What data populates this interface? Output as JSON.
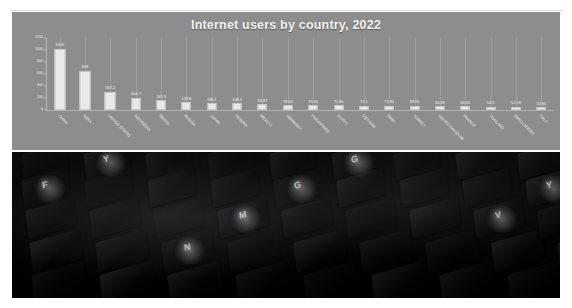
{
  "page": {
    "background_color": "#ffffff",
    "chart_panel_color": "#8d8d8d",
    "photo_caption": "dark photograph of a backlit computer keyboard viewed at an angle"
  },
  "chart_data": {
    "type": "bar",
    "title": "Internet users by country, 2022",
    "xlabel": "",
    "ylabel": "",
    "ylim": [
      0,
      1200
    ],
    "yticks": [
      0,
      200,
      400,
      600,
      800,
      1000,
      1200
    ],
    "grid": true,
    "legend": "none",
    "categories": [
      "CHINA",
      "INDIA",
      "UNITED STATES",
      "INDONESIA",
      "BRAZIL",
      "RUSSIA",
      "JAPAN",
      "NIGERIA",
      "MEXICO",
      "GERMANY",
      "PHILIPPINES",
      "EGYPT",
      "VIETNAM",
      "IRAN",
      "TURKEY",
      "UNITED KINGDOM",
      "FRANCE",
      "THAILAND",
      "BANGLADESH",
      "ITALY"
    ],
    "values": [
      1020,
      658,
      307.2,
      204.7,
      165.3,
      129.8,
      118.1,
      109.2,
      96.87,
      78.0,
      76.01,
      75.86,
      72.1,
      71.94,
      69.95,
      66.39,
      60.92,
      54.5,
      52.58,
      50.85
    ],
    "value_labels": [
      "1020",
      "658",
      "307.2",
      "204.7",
      "165.3",
      "129.8",
      "118.1",
      "109.2",
      "96.87",
      "78.00",
      "76.01",
      "75.86",
      "72.1",
      "71.94",
      "69.95",
      "66.39",
      "60.92",
      "54.5",
      "52.58",
      "50.85"
    ],
    "bar_color": "#e9e9e9",
    "title_color": "#f2f2f2",
    "label_color": "#f0f0f0"
  },
  "photo": {
    "keycap_glyphs": [
      "Y",
      "G",
      "F",
      "G",
      "Y",
      "M",
      "V",
      "N"
    ]
  }
}
